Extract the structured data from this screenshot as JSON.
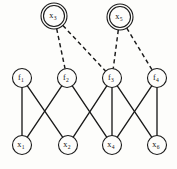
{
  "diagram": {
    "type": "factor-graph",
    "background_color": "#fdfdfb",
    "stroke_color": "#1a1a1a",
    "nodes": {
      "hidden_variables": [
        {
          "id": "x3",
          "base": "x",
          "sub": "3",
          "cx": 54,
          "cy": 16,
          "r": 10.5,
          "double_ring": true,
          "outer_r": 13.0
        },
        {
          "id": "x5",
          "base": "x",
          "sub": "5",
          "cx": 120,
          "cy": 17,
          "r": 10.5,
          "double_ring": true,
          "outer_r": 13.0
        }
      ],
      "factors": [
        {
          "id": "f1",
          "base": "f",
          "sub": "1",
          "cx": 22,
          "cy": 78,
          "r": 9.5
        },
        {
          "id": "f2",
          "base": "f",
          "sub": "2",
          "cx": 67,
          "cy": 78,
          "r": 9.5
        },
        {
          "id": "f3",
          "base": "f",
          "sub": "3",
          "cx": 112,
          "cy": 78,
          "r": 9.5
        },
        {
          "id": "f4",
          "base": "f",
          "sub": "4",
          "cx": 157,
          "cy": 78,
          "r": 9.5
        }
      ],
      "observed_variables": [
        {
          "id": "x1",
          "base": "x",
          "sub": "1",
          "cx": 22,
          "cy": 145,
          "r": 9.5
        },
        {
          "id": "x2",
          "base": "x",
          "sub": "2",
          "cx": 68,
          "cy": 145,
          "r": 9.5
        },
        {
          "id": "x4",
          "base": "x",
          "sub": "4",
          "cx": 112,
          "cy": 145,
          "r": 9.5
        },
        {
          "id": "x6",
          "base": "x",
          "sub": "6",
          "cx": 157,
          "cy": 145,
          "r": 9.5
        }
      ]
    },
    "edges_solid": [
      {
        "from": "f1",
        "to": "x1"
      },
      {
        "from": "f1",
        "to": "x2"
      },
      {
        "from": "f2",
        "to": "x1"
      },
      {
        "from": "f2",
        "to": "x4"
      },
      {
        "from": "f3",
        "to": "x2"
      },
      {
        "from": "f3",
        "to": "x4"
      },
      {
        "from": "f3",
        "to": "x6"
      },
      {
        "from": "f4",
        "to": "x4"
      },
      {
        "from": "f4",
        "to": "x6"
      }
    ],
    "edges_dashed": [
      {
        "from": "x3",
        "to": "f2"
      },
      {
        "from": "x3",
        "to": "f3"
      },
      {
        "from": "x5",
        "to": "f3"
      },
      {
        "from": "x5",
        "to": "f4"
      }
    ]
  }
}
